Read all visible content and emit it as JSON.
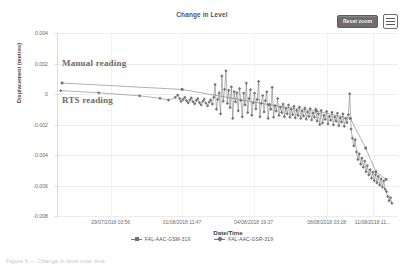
{
  "toolbar": {
    "reset_zoom_label": "Reset zoom",
    "menu_icon": "hamburger-menu-icon"
  },
  "annotations": {
    "manual": "Manual reading",
    "rts": "RTS reading"
  },
  "footer_scrap": "Figure 6 — Change in level over time",
  "chart_data": {
    "type": "scatter",
    "title": "Change in Level",
    "xlabel": "Date/Time",
    "ylabel": "Displacement (metres)",
    "grid": true,
    "legend_position": "bottom",
    "ylim": [
      -0.008,
      0.004
    ],
    "yticks": [
      "0.004",
      "0.002",
      "0",
      "-0.002",
      "-0.004",
      "-0.006",
      "-0.008"
    ],
    "ytick_values": [
      0.004,
      0.002,
      0,
      -0.002,
      -0.004,
      -0.006,
      -0.008
    ],
    "xticks": [
      "29/07/2018 03:56",
      "01/08/2018 11:47",
      "04/08/2018 19:37",
      "08/08/2018 03:28",
      "11/08/2018 11..."
    ],
    "xtick_positions": [
      0.155,
      0.365,
      0.575,
      0.79,
      0.925
    ],
    "series": [
      {
        "name": "FAL-AAC-GSM-319",
        "marker": "square",
        "color": "#6e6e6e",
        "points": [
          [
            0.012,
            0.00072
          ],
          [
            0.365,
            0.0003
          ],
          [
            0.62,
            -0.0007
          ],
          [
            0.76,
            -0.00112
          ],
          [
            0.86,
            -0.0016
          ],
          [
            0.905,
            -0.00355
          ],
          [
            0.935,
            -0.0051
          ],
          [
            0.965,
            -0.0056
          ]
        ]
      },
      {
        "name": "FAL-AAC-GSR-319",
        "marker": "diamond",
        "color": "#757575",
        "points": [
          [
            0.008,
            0.00022
          ],
          [
            0.12,
            8e-05
          ],
          [
            0.24,
            -0.00012
          ],
          [
            0.3,
            -0.00028
          ],
          [
            0.325,
            -0.0004
          ],
          [
            0.345,
            -0.00022
          ],
          [
            0.352,
            -8e-05
          ],
          [
            0.358,
            -0.0003
          ],
          [
            0.362,
            -0.00048
          ],
          [
            0.368,
            -0.00036
          ],
          [
            0.373,
            -0.00022
          ],
          [
            0.378,
            -0.00044
          ],
          [
            0.383,
            -0.00058
          ],
          [
            0.388,
            -0.0004
          ],
          [
            0.392,
            -0.00026
          ],
          [
            0.397,
            -0.0005
          ],
          [
            0.402,
            -0.00064
          ],
          [
            0.407,
            -0.00042
          ],
          [
            0.411,
            -0.0003
          ],
          [
            0.416,
            -0.00056
          ],
          [
            0.421,
            -0.00072
          ],
          [
            0.426,
            -0.00048
          ],
          [
            0.43,
            -0.00034
          ],
          [
            0.435,
            -0.0006
          ],
          [
            0.44,
            -0.00078
          ],
          [
            0.445,
            -0.00052
          ],
          [
            0.449,
            -0.00038
          ],
          [
            0.454,
            -0.00066
          ],
          [
            0.458,
            -0.00022
          ],
          [
            0.462,
            0.00062
          ],
          [
            0.466,
            -0.001
          ],
          [
            0.47,
            -0.00036
          ],
          [
            0.474,
            8e-05
          ],
          [
            0.478,
            -0.0013
          ],
          [
            0.482,
            0.00118
          ],
          [
            0.486,
            -0.00048
          ],
          [
            0.49,
            0.0003
          ],
          [
            0.494,
            0.00152
          ],
          [
            0.498,
            -0.00062
          ],
          [
            0.502,
            0.00024
          ],
          [
            0.506,
            -0.0009
          ],
          [
            0.51,
            0.00046
          ],
          [
            0.514,
            -0.0016
          ],
          [
            0.518,
            0.00016
          ],
          [
            0.522,
            -0.00052
          ],
          [
            0.526,
            8e-05
          ],
          [
            0.53,
            -0.0011
          ],
          [
            0.534,
            0.00036
          ],
          [
            0.538,
            -0.00042
          ],
          [
            0.542,
            -0.0015
          ],
          [
            0.546,
            6e-05
          ],
          [
            0.55,
            -0.00072
          ],
          [
            0.554,
            0.00072
          ],
          [
            0.558,
            -0.00122
          ],
          [
            0.562,
            -0.0003
          ],
          [
            0.566,
            0.00028
          ],
          [
            0.57,
            -0.0014
          ],
          [
            0.574,
            -0.00058
          ],
          [
            0.578,
            6e-05
          ],
          [
            0.582,
            -0.00098
          ],
          [
            0.586,
            -0.00036
          ],
          [
            0.59,
            0.00082
          ],
          [
            0.594,
            -0.0015
          ],
          [
            0.598,
            -0.00062
          ],
          [
            0.602,
            -0.0001
          ],
          [
            0.606,
            -0.00118
          ],
          [
            0.61,
            -0.00044
          ],
          [
            0.614,
            0.00014
          ],
          [
            0.618,
            -0.0016
          ],
          [
            0.622,
            -0.00068
          ],
          [
            0.626,
            -0.001
          ],
          [
            0.63,
            0.00044
          ],
          [
            0.634,
            -0.00152
          ],
          [
            0.638,
            -0.00076
          ],
          [
            0.642,
            -0.00112
          ],
          [
            0.646,
            -0.0003
          ],
          [
            0.65,
            -0.0014
          ],
          [
            0.654,
            -0.00086
          ],
          [
            0.658,
            -0.00122
          ],
          [
            0.662,
            -0.00066
          ],
          [
            0.666,
            -0.00148
          ],
          [
            0.67,
            -0.00094
          ],
          [
            0.674,
            -0.0013
          ],
          [
            0.678,
            -0.00072
          ],
          [
            0.682,
            -0.00152
          ],
          [
            0.686,
            -0.001
          ],
          [
            0.69,
            -0.00136
          ],
          [
            0.694,
            -0.0008
          ],
          [
            0.698,
            -0.00156
          ],
          [
            0.702,
            -0.00108
          ],
          [
            0.706,
            -0.0014
          ],
          [
            0.71,
            -0.00086
          ],
          [
            0.714,
            -0.0016
          ],
          [
            0.718,
            -0.00112
          ],
          [
            0.722,
            -0.00144
          ],
          [
            0.726,
            -0.00092
          ],
          [
            0.73,
            -0.00164
          ],
          [
            0.734,
            -0.00118
          ],
          [
            0.738,
            -0.00148
          ],
          [
            0.742,
            -0.00096
          ],
          [
            0.746,
            -0.0017
          ],
          [
            0.75,
            -0.00124
          ],
          [
            0.754,
            -0.00152
          ],
          [
            0.758,
            -0.001
          ],
          [
            0.762,
            -0.00178
          ],
          [
            0.766,
            -0.0013
          ],
          [
            0.77,
            -0.002
          ],
          [
            0.774,
            -0.00108
          ],
          [
            0.778,
            -0.0019
          ],
          [
            0.782,
            -0.0014
          ],
          [
            0.786,
            -0.00166
          ],
          [
            0.79,
            -0.00114
          ],
          [
            0.794,
            -0.00196
          ],
          [
            0.798,
            -0.00146
          ],
          [
            0.802,
            -0.00172
          ],
          [
            0.806,
            -0.0012
          ],
          [
            0.81,
            -0.00202
          ],
          [
            0.814,
            -0.0015
          ],
          [
            0.818,
            -0.00178
          ],
          [
            0.822,
            -0.00126
          ],
          [
            0.826,
            -0.00208
          ],
          [
            0.83,
            -0.00156
          ],
          [
            0.834,
            -0.00184
          ],
          [
            0.838,
            -0.0013
          ],
          [
            0.842,
            -0.00212
          ],
          [
            0.846,
            -0.0016
          ],
          [
            0.85,
            -0.00188
          ],
          [
            0.854,
            -0.00136
          ],
          [
            0.858,
            2e-05
          ],
          [
            0.862,
            -0.0023
          ],
          [
            0.866,
            -0.0029
          ],
          [
            0.87,
            -0.0034
          ],
          [
            0.874,
            -0.003
          ],
          [
            0.878,
            -0.0038
          ],
          [
            0.882,
            -0.0043
          ],
          [
            0.886,
            -0.00392
          ],
          [
            0.89,
            -0.0046
          ],
          [
            0.894,
            -0.0042
          ],
          [
            0.898,
            -0.0048
          ],
          [
            0.902,
            -0.0044
          ],
          [
            0.906,
            -0.0051
          ],
          [
            0.91,
            -0.0047
          ],
          [
            0.914,
            -0.0053
          ],
          [
            0.918,
            -0.00496
          ],
          [
            0.922,
            -0.00552
          ],
          [
            0.926,
            -0.00512
          ],
          [
            0.93,
            -0.00568
          ],
          [
            0.934,
            -0.00528
          ],
          [
            0.938,
            -0.00582
          ],
          [
            0.942,
            -0.0054
          ],
          [
            0.946,
            -0.00596
          ],
          [
            0.95,
            -0.00556
          ],
          [
            0.954,
            -0.0061
          ],
          [
            0.958,
            -0.0057
          ],
          [
            0.962,
            -0.00624
          ],
          [
            0.966,
            -0.0064
          ],
          [
            0.97,
            -0.00672
          ],
          [
            0.974,
            -0.007
          ],
          [
            0.978,
            -0.0068
          ],
          [
            0.982,
            -0.00716
          ]
        ]
      }
    ]
  }
}
